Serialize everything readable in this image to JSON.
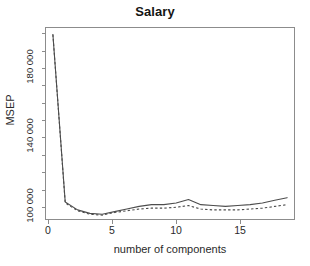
{
  "figure": {
    "title": "Salary",
    "xlabel": "number of components",
    "ylabel": "MSEP",
    "ytick_labels": [
      "100 000",
      "140 000",
      "180 000"
    ],
    "xtick_labels": [
      "0",
      "5",
      "10",
      "15"
    ],
    "line_color": "#4d4d4d",
    "axis_color": "#8c8c8c",
    "background": "#ffffff"
  },
  "chart_data": {
    "type": "line",
    "title": "Salary",
    "xlabel": "number of components",
    "ylabel": "MSEP",
    "xlim": [
      -0.6,
      19.6
    ],
    "ylim": [
      96000,
      206000
    ],
    "xticks": [
      0,
      5,
      10,
      15
    ],
    "xticklabels": [
      "0",
      "5",
      "10",
      "15"
    ],
    "yticks": [
      100000,
      140000,
      180000
    ],
    "yticklabels": [
      "100 000",
      "140 000",
      "180 000"
    ],
    "grid": false,
    "legend": "none",
    "x": [
      0,
      1,
      2,
      3,
      4,
      5,
      6,
      7,
      8,
      9,
      10,
      11,
      12,
      13,
      14,
      15,
      16,
      17,
      18,
      19
    ],
    "series": [
      {
        "name": "CV",
        "style": "solid",
        "values": [
          202000,
          106000,
          101500,
          99500,
          99000,
          100500,
          102000,
          103500,
          104500,
          104500,
          105500,
          107500,
          104500,
          104000,
          103500,
          104000,
          104500,
          105500,
          107000,
          108500
        ]
      },
      {
        "name": "adjCV",
        "style": "dashed",
        "values": [
          202000,
          105500,
          101000,
          99000,
          98500,
          100000,
          101000,
          102000,
          102500,
          102500,
          103000,
          104000,
          102000,
          101500,
          101500,
          101500,
          102000,
          102500,
          103500,
          104500
        ]
      }
    ]
  }
}
